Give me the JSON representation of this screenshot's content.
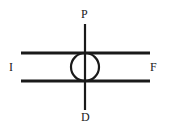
{
  "figure": {
    "kind": "line-schematic",
    "background_color": "#ffffff",
    "stroke_color": "#1a1a1a",
    "width": 170,
    "height": 132
  },
  "labels": {
    "top": "P",
    "bottom": "D",
    "left": "I",
    "right": "F"
  },
  "elements": {
    "vertical_line": {
      "name": "vertical-axis-line",
      "x": 85,
      "y1": 24,
      "y2": 110,
      "stroke_width": 2.2
    },
    "horizontal_line_top": {
      "name": "upper-horizontal-line",
      "y": 53,
      "x1": 21,
      "x2": 150,
      "stroke_width": 3.2
    },
    "horizontal_line_bottom": {
      "name": "lower-horizontal-line",
      "y": 81,
      "x1": 21,
      "x2": 150,
      "stroke_width": 3.2
    },
    "circle": {
      "name": "center-circle",
      "cx": 85,
      "cy": 67,
      "r": 14,
      "stroke_width": 2.2,
      "fill": "none"
    }
  }
}
